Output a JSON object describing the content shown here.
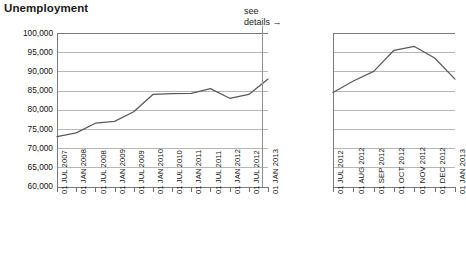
{
  "title": "Unemployment",
  "annotation": {
    "line1": "see",
    "line2": "details →"
  },
  "colors": {
    "line": "#58595b",
    "grid": "#b6b6b6",
    "axis": "#7a7a7a",
    "text": "#1a1a1a"
  },
  "chart_data": [
    {
      "type": "line",
      "title": "Unemployment",
      "id": "overview",
      "xlabel": "",
      "ylabel": "",
      "ylim": [
        60000,
        100000
      ],
      "ytick_labels": [
        "100,000",
        "95,000",
        "90,000",
        "85,000",
        "80,000",
        "75,000",
        "70,000",
        "65,000",
        "60,000"
      ],
      "yticks": [
        100000,
        95000,
        90000,
        85000,
        80000,
        75000,
        70000,
        65000,
        60000
      ],
      "grid": true,
      "legend": "none",
      "categories": [
        "01 JUL 2007",
        "01 JAN 2008",
        "01 JUL 2008",
        "01 JAN 2009",
        "01 JUL 2009",
        "01 JAN 2010",
        "01 JUL 2010",
        "01 JAN 2011",
        "01 JUL 2011",
        "01 JAN 2012",
        "01 JUL 2012",
        "01 JAN 2013"
      ],
      "values": [
        73000,
        74000,
        76500,
        77000,
        79500,
        84000,
        84200,
        84300,
        85500,
        83000,
        84000,
        88000
      ]
    },
    {
      "type": "line",
      "title": "",
      "id": "detail",
      "xlabel": "",
      "ylabel": "",
      "ylim": [
        60000,
        100000
      ],
      "yticks": [
        100000,
        95000,
        90000,
        85000,
        80000,
        75000,
        70000,
        65000,
        60000
      ],
      "grid": true,
      "legend": "none",
      "categories": [
        "01 JUL 2012",
        "01 AUG 2012",
        "01 SEP 2012",
        "01 OCT 2012",
        "01 NOV 2012",
        "01 DEC 2012",
        "01 JAN 2013"
      ],
      "values": [
        84500,
        87500,
        90000,
        95500,
        96500,
        93500,
        88000
      ]
    }
  ]
}
